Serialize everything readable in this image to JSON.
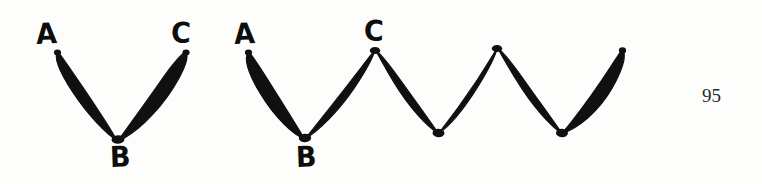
{
  "page": {
    "background_color": "#fdfdfb",
    "ink_color": "#101010",
    "width": 762,
    "height": 184,
    "page_number": "95"
  },
  "figures": [
    {
      "id": "figure-v",
      "name": "v-shape-loop-diagram",
      "description": "Two elongated lens-shaped loops meeting at a lower vertex, forming a V",
      "vertices": [
        {
          "label": "A",
          "x": 57,
          "y": 52,
          "kind": "endpoint"
        },
        {
          "label": "B",
          "x": 118,
          "y": 140,
          "kind": "valley"
        },
        {
          "label": "C",
          "x": 186,
          "y": 52,
          "kind": "endpoint"
        }
      ],
      "labels": [
        {
          "text": "A",
          "x": 36,
          "y": 20
        },
        {
          "text": "C",
          "x": 171,
          "y": 19
        },
        {
          "text": "B",
          "x": 110,
          "y": 143
        }
      ]
    },
    {
      "id": "figure-zigzag",
      "name": "zigzag-loop-diagram",
      "description": "Chain of elongated lens-shaped loops forming a zigzag with two peaks and two valleys after B",
      "vertices": [
        {
          "label": "A",
          "x": 248,
          "y": 52,
          "kind": "endpoint"
        },
        {
          "label": "B",
          "x": 305,
          "y": 138,
          "kind": "valley"
        },
        {
          "label": "C",
          "x": 375,
          "y": 50,
          "kind": "peak"
        },
        {
          "label": "",
          "x": 438,
          "y": 133,
          "kind": "valley"
        },
        {
          "label": "",
          "x": 497,
          "y": 48,
          "kind": "peak"
        },
        {
          "label": "",
          "x": 562,
          "y": 133,
          "kind": "valley"
        },
        {
          "label": "",
          "x": 622,
          "y": 50,
          "kind": "endpoint"
        }
      ],
      "labels": [
        {
          "text": "A",
          "x": 234,
          "y": 20
        },
        {
          "text": "C",
          "x": 364,
          "y": 17
        },
        {
          "text": "B",
          "x": 296,
          "y": 143
        }
      ]
    }
  ]
}
